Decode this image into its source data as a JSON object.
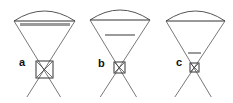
{
  "panels": [
    {
      "label": "a",
      "chord": {
        "x1": 14,
        "x2": 75,
        "y": 21
      },
      "arc_top": 11,
      "apex": {
        "x": 44,
        "y": 70
      },
      "bar": {
        "x1": 20,
        "x2": 70,
        "y": 23,
        "h": 3
      },
      "box": {
        "x": 36,
        "y": 61,
        "w": 17,
        "h": 17
      },
      "label_pos": {
        "x": 19,
        "y": 66
      },
      "ray_end_y": 97
    },
    {
      "label": "b",
      "chord": {
        "x1": 90,
        "x2": 150,
        "y": 20
      },
      "arc_top": 10,
      "apex": {
        "x": 119,
        "y": 68
      },
      "bar": {
        "x1": 105,
        "x2": 135,
        "y": 34,
        "h": 2
      },
      "box": {
        "x": 114,
        "y": 62,
        "w": 11,
        "h": 11
      },
      "label_pos": {
        "x": 98,
        "y": 67
      },
      "ray_end_y": 97
    },
    {
      "label": "c",
      "chord": {
        "x1": 166,
        "x2": 225,
        "y": 21
      },
      "arc_top": 11,
      "apex": {
        "x": 194,
        "y": 68
      },
      "bar": {
        "x1": 188,
        "x2": 201,
        "y": 52,
        "h": 2
      },
      "box": {
        "x": 190,
        "y": 63,
        "w": 9,
        "h": 9
      },
      "label_pos": {
        "x": 176,
        "y": 66
      },
      "ray_end_y": 97
    }
  ],
  "colors": {
    "line": "#555555",
    "bar": "#9a9a9a",
    "box": "#333333"
  }
}
